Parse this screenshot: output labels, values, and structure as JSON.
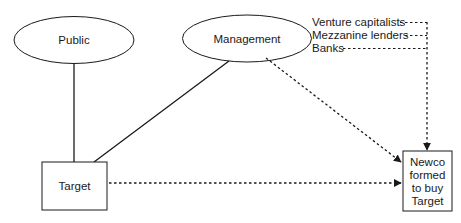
{
  "diagram": {
    "type": "flow",
    "nodes": {
      "public": {
        "label": "Public",
        "shape": "ellipse"
      },
      "management": {
        "label": "Management",
        "shape": "ellipse"
      },
      "target": {
        "label": "Target",
        "shape": "rectangle"
      },
      "newco": {
        "label_lines": [
          "Newco",
          "formed",
          "to buy",
          "Target"
        ],
        "shape": "rectangle"
      }
    },
    "funding_sources": [
      {
        "label": "Venture capitalists"
      },
      {
        "label": "Mezzanine lenders"
      },
      {
        "label": "Banks"
      }
    ],
    "edges": [
      {
        "from": "Public",
        "to": "Target",
        "style": "solid"
      },
      {
        "from": "Management",
        "to": "Target",
        "style": "solid"
      },
      {
        "from": "Management",
        "to": "Newco formed to buy Target",
        "style": "dotted-arrow"
      },
      {
        "from": "Target",
        "to": "Newco formed to buy Target",
        "style": "dotted-arrow"
      },
      {
        "from": "Venture capitalists",
        "to": "Newco formed to buy Target",
        "style": "dotted-arrow"
      },
      {
        "from": "Mezzanine lenders",
        "to": "Newco formed to buy Target",
        "style": "dotted-arrow"
      },
      {
        "from": "Banks",
        "to": "Newco formed to buy Target",
        "style": "dotted-arrow"
      }
    ],
    "colors": {
      "stroke": "#1a1a1a",
      "background": "#ffffff"
    }
  }
}
